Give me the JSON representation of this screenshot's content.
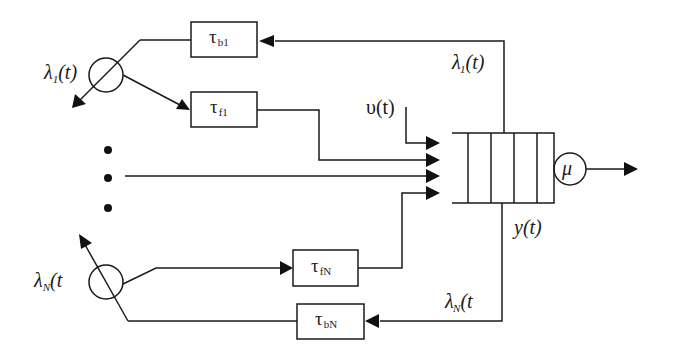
{
  "diagram": {
    "title": "",
    "colors": {
      "stroke": "#1a1a1a",
      "background": "#ffffff"
    },
    "sources": [
      {
        "id": "source-1",
        "symbol": "λ",
        "index": "1",
        "arg": "(t)"
      },
      {
        "id": "source-N",
        "symbol": "λ",
        "index": "N",
        "arg": "(t"
      }
    ],
    "delay_boxes": {
      "tau_b1": {
        "symbol": "τ",
        "sub": "b1"
      },
      "tau_f1": {
        "symbol": "τ",
        "sub": "f1"
      },
      "tau_fN": {
        "symbol": "τ",
        "sub": "fN"
      },
      "tau_bN": {
        "symbol": "τ",
        "sub": "bN"
      }
    },
    "feedback_labels": {
      "lambda1_prime": {
        "symbol": "λ",
        "prime": "'",
        "index": "1",
        "arg": "(t)"
      },
      "lambdaN_prime": {
        "symbol": "λ",
        "prime": "'",
        "index": "N",
        "arg": "(t"
      }
    },
    "external_input": "υ(t)",
    "queue_output": "y(t)",
    "server": {
      "symbol": "μ"
    },
    "ellipsis_dots": 3,
    "queue_slots": 5
  }
}
